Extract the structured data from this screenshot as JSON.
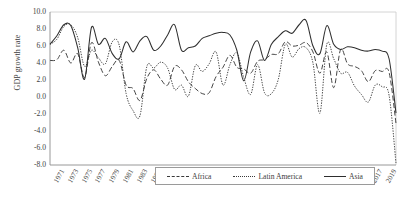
{
  "chart_data": {
    "type": "line",
    "title": "",
    "xlabel": "",
    "ylabel": "GDP growth rate",
    "ylim": [
      -8.0,
      10.0
    ],
    "ytick_labels": [
      "10.0",
      "8.0",
      "6.0",
      "4.0",
      "2.0",
      "0.0",
      "-2.0",
      "-4.0",
      "-6.0",
      "-8.0"
    ],
    "ytick_values": [
      10.0,
      8.0,
      6.0,
      4.0,
      2.0,
      0.0,
      -2.0,
      -4.0,
      -6.0,
      -8.0
    ],
    "grid": false,
    "legend_position": "bottom-center",
    "x": [
      1970,
      1971,
      1972,
      1973,
      1974,
      1975,
      1976,
      1977,
      1978,
      1979,
      1980,
      1981,
      1982,
      1983,
      1984,
      1985,
      1986,
      1987,
      1988,
      1989,
      1990,
      1991,
      1992,
      1993,
      1994,
      1995,
      1996,
      1997,
      1998,
      1999,
      2000,
      2001,
      2002,
      2003,
      2004,
      2005,
      2006,
      2007,
      2008,
      2009,
      2010,
      2011,
      2012,
      2013,
      2014,
      2015,
      2016,
      2017,
      2018,
      2019,
      2020
    ],
    "xtick_labels": [
      "1971",
      "1973",
      "1975",
      "1977",
      "1979",
      "1981",
      "1983",
      "1985",
      "1987",
      "1989",
      "1991",
      "1993",
      "1995",
      "1997",
      "1999",
      "2001",
      "2003",
      "2005",
      "2007",
      "2009",
      "2011",
      "2013",
      "2015",
      "2017",
      "2019"
    ],
    "xtick_values": [
      1971,
      1973,
      1975,
      1977,
      1979,
      1981,
      1983,
      1985,
      1987,
      1989,
      1991,
      1993,
      1995,
      1997,
      1999,
      2001,
      2003,
      2005,
      2007,
      2009,
      2011,
      2013,
      2015,
      2017,
      2019
    ],
    "series": [
      {
        "name": "Africa",
        "style": "dashed",
        "color": "#3a3a3a",
        "values": [
          4.3,
          4.4,
          5.5,
          4.0,
          5.1,
          2.3,
          6.4,
          4.1,
          2.5,
          3.6,
          4.3,
          1.4,
          1.0,
          -0.4,
          2.2,
          3.2,
          2.1,
          1.4,
          3.6,
          3.2,
          1.8,
          1.0,
          0.4,
          0.5,
          2.4,
          3.5,
          4.9,
          3.5,
          3.3,
          2.8,
          4.2,
          4.4,
          5.0,
          5.1,
          6.5,
          6.0,
          6.1,
          6.4,
          5.3,
          2.8,
          5.3,
          1.1,
          5.6,
          3.9,
          3.6,
          3.1,
          1.8,
          3.1,
          3.0,
          2.9,
          -3.1
        ]
      },
      {
        "name": "Latin America",
        "style": "dotted",
        "color": "#3a3a3a",
        "values": [
          6.2,
          6.8,
          8.3,
          8.5,
          7.0,
          3.6,
          5.5,
          4.6,
          3.9,
          6.5,
          6.1,
          0.4,
          -1.6,
          -2.2,
          3.6,
          3.4,
          4.1,
          3.4,
          0.9,
          1.4,
          0.1,
          3.7,
          3.0,
          3.9,
          5.3,
          1.4,
          3.8,
          5.2,
          2.3,
          0.3,
          3.8,
          0.5,
          0.4,
          2.1,
          6.2,
          4.7,
          5.7,
          5.8,
          4.0,
          -1.9,
          6.2,
          4.5,
          2.8,
          2.9,
          1.3,
          0.3,
          -0.6,
          1.4,
          1.2,
          0.2,
          -7.8
        ]
      },
      {
        "name": "Asia",
        "style": "solid",
        "color": "#2e2e2e",
        "values": [
          6.2,
          7.2,
          8.5,
          8.4,
          5.8,
          2.1,
          8.2,
          6.2,
          6.9,
          5.1,
          4.5,
          6.5,
          5.3,
          6.6,
          7.1,
          5.5,
          6.0,
          7.3,
          8.5,
          5.5,
          5.8,
          6.0,
          6.9,
          7.2,
          7.5,
          7.6,
          7.3,
          5.5,
          1.9,
          5.3,
          6.6,
          4.3,
          6.2,
          7.1,
          7.8,
          7.5,
          8.5,
          9.0,
          6.0,
          5.1,
          8.4,
          6.2,
          5.6,
          5.9,
          5.8,
          5.5,
          5.4,
          5.6,
          5.4,
          4.5,
          -1.9
        ]
      }
    ]
  }
}
